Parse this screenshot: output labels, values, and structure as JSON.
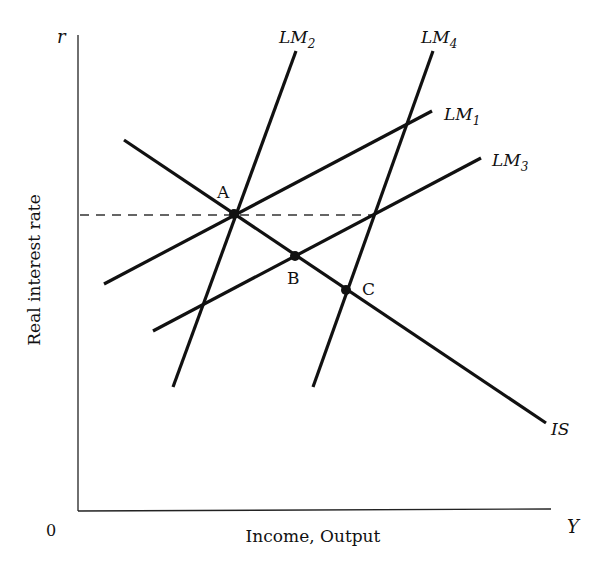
{
  "diagram": {
    "y_axis": {
      "symbol": "r",
      "label": "Real interest rate"
    },
    "x_axis": {
      "symbol": "Y",
      "label": "Income, Output",
      "origin": "0"
    },
    "curves": [
      {
        "id": "IS",
        "label": "IS",
        "sub": ""
      },
      {
        "id": "LM1",
        "label": "LM",
        "sub": "1"
      },
      {
        "id": "LM2",
        "label": "LM",
        "sub": "2"
      },
      {
        "id": "LM3",
        "label": "LM",
        "sub": "3"
      },
      {
        "id": "LM4",
        "label": "LM",
        "sub": "4"
      }
    ],
    "points": [
      {
        "id": "A",
        "label": "A"
      },
      {
        "id": "B",
        "label": "B"
      },
      {
        "id": "C",
        "label": "C"
      }
    ],
    "reference_line": "dashed horizontal line at interest rate of point A"
  },
  "colors": {
    "line": "#111111",
    "background": "#ffffff",
    "dashed": "#333333"
  }
}
